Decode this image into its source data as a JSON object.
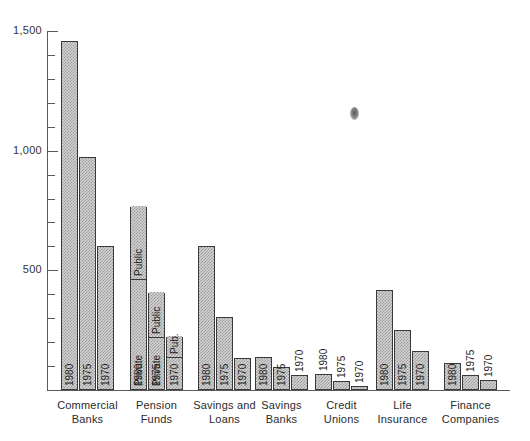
{
  "chart_data": {
    "type": "bar",
    "title": "",
    "subtitle": "",
    "xlabel": "",
    "ylabel": "",
    "ylim": [
      0,
      1500
    ],
    "y_ticks_major": [
      500,
      1000,
      1500
    ],
    "y_tick_labels": [
      "500",
      "1,000",
      "1,500"
    ],
    "y_tick_minor_interval": 100,
    "grid": false,
    "legend": "none",
    "series_labels": [
      "1980",
      "1975",
      "1970"
    ],
    "categories": [
      "Commercial Banks",
      "Pension Funds",
      "Savings and Loans",
      "Savings Banks",
      "Credit Unions",
      "Life Insurance",
      "Finance Companies"
    ],
    "groups": [
      {
        "name": "Commercial Banks",
        "label_lines": [
          "Commercial",
          "Banks"
        ],
        "bars": [
          {
            "year": "1980",
            "value": 1460,
            "label_position": "inside"
          },
          {
            "year": "1975",
            "value": 975,
            "label_position": "inside"
          },
          {
            "year": "1970",
            "value": 601,
            "label_position": "inside"
          }
        ]
      },
      {
        "name": "Pension Funds",
        "label_lines": [
          "Pension",
          "Funds"
        ],
        "stacked": true,
        "stack_labels": [
          "Private",
          "Public"
        ],
        "bars": [
          {
            "year": "1980",
            "value": 765,
            "label_position": "inside",
            "segments": [
              {
                "name": "Private",
                "value": 455,
                "text": "Private"
              },
              {
                "name": "Public",
                "value": 310,
                "text": "Public"
              }
            ]
          },
          {
            "year": "1975",
            "value": 405,
            "label_position": "inside",
            "segments": [
              {
                "name": "Private",
                "value": 215,
                "text": "Private"
              },
              {
                "name": "Public",
                "value": 190,
                "text": "Public"
              }
            ]
          },
          {
            "year": "1970",
            "value": 222,
            "label_position": "inside",
            "segments": [
              {
                "name": "Private",
                "value": 130,
                "text": ""
              },
              {
                "name": "Public",
                "value": 92,
                "text": "Pub."
              }
            ]
          }
        ]
      },
      {
        "name": "Savings and Loans",
        "label_lines": [
          "Savings and",
          "Loans"
        ],
        "bars": [
          {
            "year": "1980",
            "value": 600,
            "label_position": "inside"
          },
          {
            "year": "1975",
            "value": 305,
            "label_position": "inside"
          },
          {
            "year": "1970",
            "value": 134,
            "label_position": "inside"
          }
        ]
      },
      {
        "name": "Savings Banks",
        "label_lines": [
          "Savings",
          "Banks"
        ],
        "bars": [
          {
            "year": "1980",
            "value": 138,
            "label_position": "inside"
          },
          {
            "year": "1975",
            "value": 96,
            "label_position": "inside"
          },
          {
            "year": "1970",
            "value": 63,
            "label_position": "outside"
          }
        ]
      },
      {
        "name": "Credit Unions",
        "label_lines": [
          "Credit",
          "Unions"
        ],
        "bars": [
          {
            "year": "1980",
            "value": 68,
            "label_position": "outside"
          },
          {
            "year": "1975",
            "value": 38,
            "label_position": "outside"
          },
          {
            "year": "1970",
            "value": 17,
            "label_position": "outside"
          }
        ]
      },
      {
        "name": "Life Insurance",
        "label_lines": [
          "Life",
          "Insurance"
        ],
        "bars": [
          {
            "year": "1980",
            "value": 418,
            "label_position": "inside"
          },
          {
            "year": "1975",
            "value": 250,
            "label_position": "inside"
          },
          {
            "year": "1970",
            "value": 163,
            "label_position": "inside"
          }
        ]
      },
      {
        "name": "Finance Companies",
        "label_lines": [
          "Finance",
          "Companies"
        ],
        "bars": [
          {
            "year": "1980",
            "value": 112,
            "label_position": "inside"
          },
          {
            "year": "1975",
            "value": 63,
            "label_position": "outside"
          },
          {
            "year": "1970",
            "value": 41,
            "label_position": "outside"
          }
        ]
      }
    ]
  },
  "colors": {
    "bar_fill": "#d2d2d2",
    "bar_stroke": "#3a3a3a",
    "axis": "#5a5a5a",
    "text": "#2b2b2b",
    "background": "#ffffff"
  }
}
